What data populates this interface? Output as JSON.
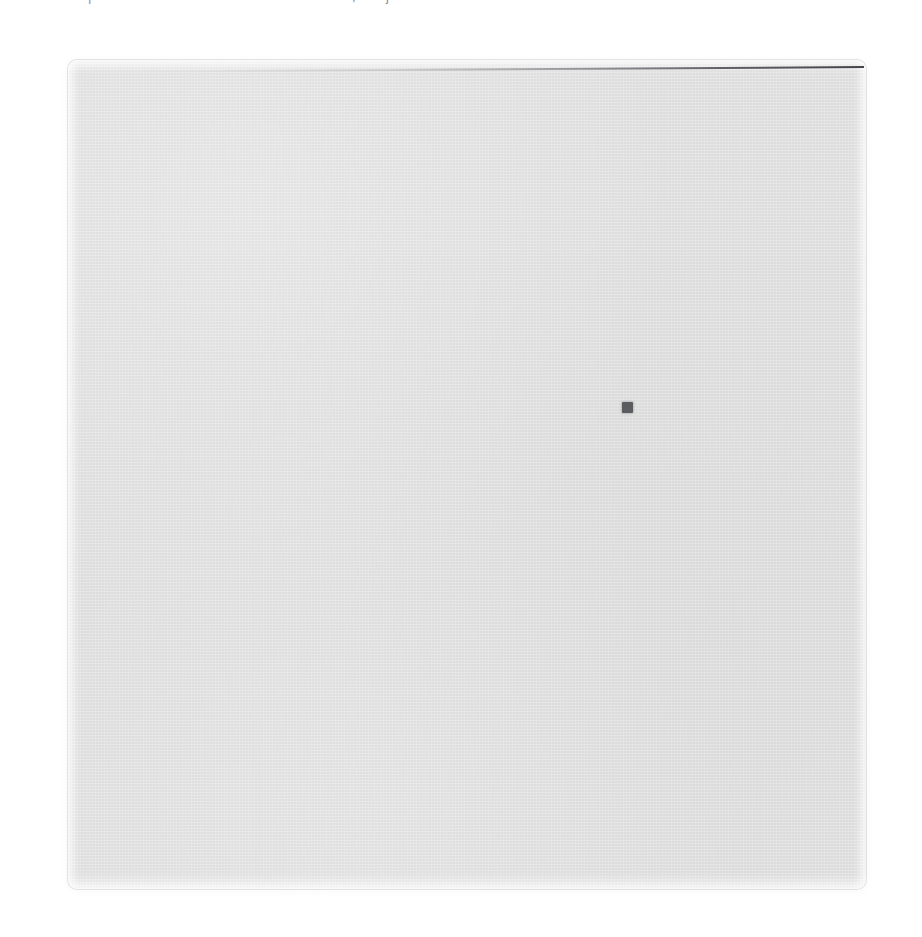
{
  "document": {
    "title": "",
    "background_color": "#ffffff"
  },
  "clipped_text": {
    "note": "row of text clipped by the top edge of the frame; only descender strokes remain legible",
    "segments": [
      {
        "id": "seg-1",
        "text": "|"
      },
      {
        "id": "seg-2",
        "text": ""
      },
      {
        "id": "seg-3",
        "text": ","
      },
      {
        "id": "seg-4",
        "text": "j"
      }
    ],
    "color": "#5d6068"
  },
  "panel": {
    "label": "",
    "content": "",
    "fill_color": "#e2e2e2",
    "border_color": "#cdcdcd",
    "corner_radius_px": 9,
    "x": 68,
    "y": 60,
    "width": 798,
    "height": 829
  },
  "top_rule": {
    "label": "",
    "color_light": "#787a7e",
    "color_dark": "#34363c",
    "x": 68,
    "y": 71,
    "width": 796
  },
  "marker": {
    "label": "",
    "color": "#5a5c60",
    "x": 622,
    "y": 402,
    "size": 11
  }
}
